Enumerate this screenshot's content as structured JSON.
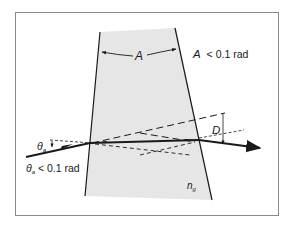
{
  "figure": {
    "type": "thin-prism-refraction-diagram",
    "labels": {
      "apex_angle": "A",
      "apex_condition": "A < 0.1 rad",
      "incidence_angle_symbol": "θ",
      "incidence_angle_subscript": "a",
      "incidence_condition": "θa < 0.1 rad",
      "incidence_condition_theta": "θ",
      "incidence_condition_sub": "a",
      "incidence_condition_rest": " < 0.1 rad",
      "deviation": "D",
      "refractive_index_symbol": "n",
      "refractive_index_subscript": "g"
    },
    "colors": {
      "background": "#ffffff",
      "frame": "#8a8a8a",
      "prism_fill": "#e6e6e6",
      "lines": "#1a1a1a"
    }
  }
}
